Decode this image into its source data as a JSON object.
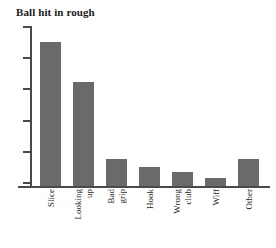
{
  "chart_data": {
    "type": "bar",
    "title": "Ball hit in rough",
    "xlabel": "",
    "ylabel": "",
    "categories": [
      "Slice",
      "Looking up",
      "Bad grip",
      "Hook",
      "Wrong club",
      "Wiff",
      "Other"
    ],
    "category_lines": [
      [
        "Slice"
      ],
      [
        "Looking",
        "up"
      ],
      [
        "Bad",
        "grip"
      ],
      [
        "Hook"
      ],
      [
        "Wrong",
        "club"
      ],
      [
        "Wiff"
      ],
      [
        "Other"
      ]
    ],
    "values": [
      90,
      65,
      17,
      12,
      9,
      5,
      17
    ],
    "ylim": [
      0,
      100
    ],
    "ytick_count": 6,
    "ytick_labels": [],
    "grid": false,
    "legend": false,
    "bar_color": "#6a6a6a",
    "axis_color": "#4a4a4a",
    "title_color": "#1a1a1a",
    "label_color": "#262626",
    "background": "#ffffff"
  }
}
